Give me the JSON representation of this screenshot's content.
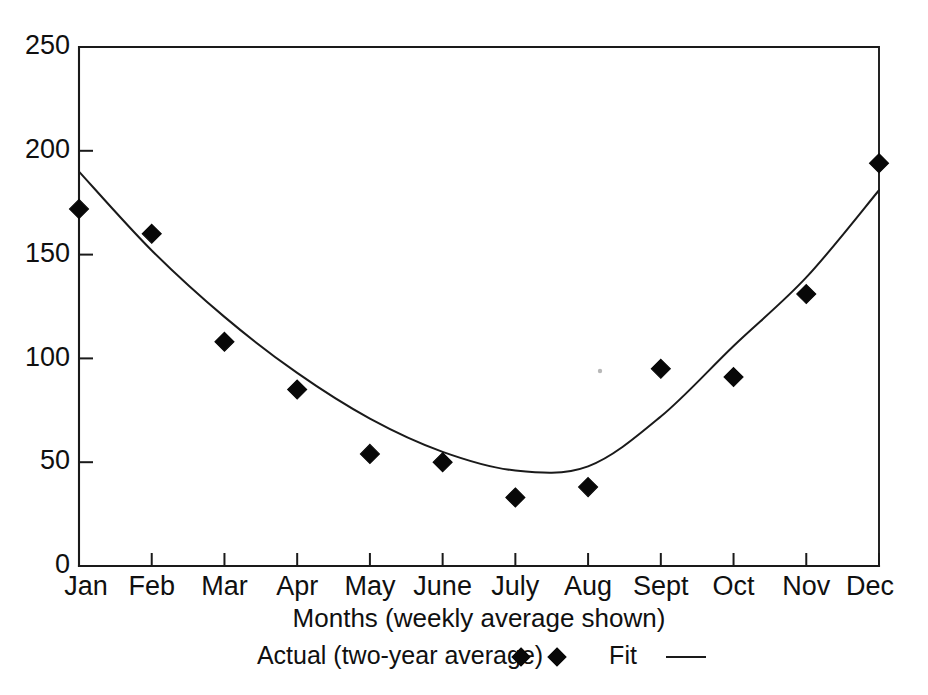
{
  "chart_data": {
    "type": "scatter",
    "title": "",
    "xlabel": "Months (weekly average shown)",
    "ylabel": "",
    "categories": [
      "Jan",
      "Feb",
      "Mar",
      "Apr",
      "May",
      "June",
      "July",
      "Aug",
      "Sept",
      "Oct",
      "Nov",
      "Dec"
    ],
    "xlim": [
      0,
      11
    ],
    "ylim": [
      0,
      250
    ],
    "yticks": [
      0,
      50,
      100,
      150,
      200,
      250
    ],
    "ytick_labels": [
      "0",
      "50",
      "100",
      "150",
      "200",
      "250"
    ],
    "grid": false,
    "legend_position": "below-axis-title",
    "series": [
      {
        "name": "Actual (two-year average)",
        "marker": "diamond",
        "type": "scatter",
        "color": "#080808",
        "values": [
          172,
          160,
          108,
          85,
          54,
          50,
          33,
          38,
          95,
          91,
          131,
          194
        ]
      },
      {
        "name": "Fit",
        "marker": "none",
        "type": "line",
        "color": "#1a1a1a",
        "values": [
          190,
          152,
          120,
          93,
          71,
          55,
          46,
          48,
          72,
          106,
          139,
          181
        ]
      }
    ],
    "legend_entries": [
      {
        "label": "Actual (two-year average)",
        "symbol": "diamond-pair"
      },
      {
        "label": "Fit",
        "symbol": "line"
      }
    ]
  },
  "axis": {
    "x_title": "Months (weekly average shown)"
  }
}
